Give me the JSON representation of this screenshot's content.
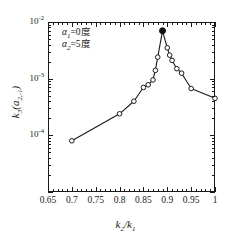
{
  "chart_data": {
    "type": "line",
    "title": "",
    "subtitle": "",
    "xlabel": "k2/k1",
    "ylabel": "k3(a2,-1)",
    "xscale": "linear",
    "yscale": "log",
    "xlim": [
      0.65,
      1.0
    ],
    "ylim": [
      1e-05,
      0.01
    ],
    "grid": false,
    "legend": null,
    "xticks": [
      "0.65",
      "0.7",
      "0.75",
      "0.8",
      "0.85",
      "0.9",
      "0.95",
      "1"
    ],
    "xtick_values": [
      0.65,
      0.7,
      0.75,
      0.8,
      0.85,
      0.9,
      0.95,
      1.0
    ],
    "ytick_values": [
      0.01,
      0.001,
      0.0001
    ],
    "ytick_labels": [
      "10-2",
      "10-3",
      "10-4"
    ],
    "series": [
      {
        "name": "k3(a2,-1)",
        "marker": "circle-open",
        "line_color": "#1a1a1a",
        "x": [
          0.7,
          0.8,
          0.83,
          0.85,
          0.86,
          0.87,
          0.875,
          0.88,
          0.89,
          0.9,
          0.905,
          0.91,
          0.92,
          0.93,
          0.95,
          1.0
        ],
        "y": [
          8e-05,
          0.00024,
          0.0004,
          0.0007,
          0.00078,
          0.00095,
          0.0014,
          0.0024,
          0.007,
          0.0035,
          0.0026,
          0.0021,
          0.0015,
          0.00125,
          0.00067,
          0.00045
        ]
      }
    ],
    "highlight_point": {
      "x": 0.89,
      "y": 0.007,
      "marker": "circle-filled",
      "color": "#111111"
    },
    "annotations": [
      {
        "text_alpha": "α",
        "text_sub": "1",
        "text_rest": "=0度"
      },
      {
        "text_alpha": "α",
        "text_sub": "2",
        "text_rest": "=5度"
      }
    ],
    "annotation_lines": [
      "α1=0度",
      "α2=5度"
    ]
  },
  "axis": {
    "x_title_num": "k",
    "x_title_num_sub": "2",
    "x_title_den": "k",
    "x_title_den_sub": "1",
    "y_title_main": "k",
    "y_title_main_sub": "3",
    "y_title_args": "(a",
    "y_title_args_sub": "2,-1",
    "y_title_close": ")"
  },
  "colors": {
    "line": "#1a1a1a",
    "marker_fill": "#ffffff",
    "marker_edge": "#1a1a1a",
    "highlight": "#111111",
    "background": "#ffffff",
    "frame": "#1a1a1a"
  }
}
